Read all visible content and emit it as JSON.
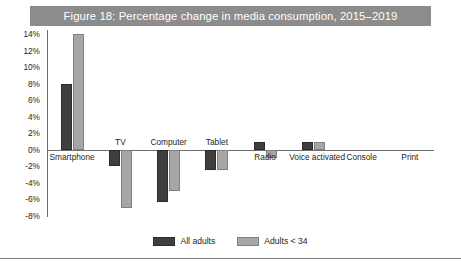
{
  "figure": {
    "title": "Figure 18: Percentage change in media consumption, 2015–2019",
    "title_bar_color": "#8c8c8c"
  },
  "legend": {
    "position": "bottom-center",
    "items": [
      {
        "label": "All adults",
        "color": "#3f3f3f",
        "swatch": "dark-swatch"
      },
      {
        "label": "Adults < 34",
        "color": "#a6a6a6",
        "swatch": "light-swatch"
      }
    ]
  },
  "axis": {
    "yticks": [
      "14%",
      "12%",
      "10%",
      "8%",
      "6%",
      "4%",
      "2%",
      "0%",
      "-2%",
      "-4%",
      "-6%",
      "-8%"
    ],
    "ytick_values": [
      14,
      12,
      10,
      8,
      6,
      4,
      2,
      0,
      -2,
      -4,
      -6,
      -8
    ]
  },
  "chart_data": {
    "type": "bar",
    "title": "Figure 18: Percentage change in media consumption, 2015–2019",
    "xlabel": "",
    "ylabel": "",
    "ylim": [
      -8,
      14
    ],
    "ytick_step": 2,
    "grid": false,
    "legend_position": "bottom-center",
    "categories": [
      "Smartphone",
      "TV",
      "Computer",
      "Tablet",
      "Radio",
      "Voice activated",
      "Console",
      "Print"
    ],
    "series": [
      {
        "name": "All adults",
        "color": "#3f3f3f",
        "values": [
          8,
          -2,
          -6.3,
          -2.5,
          1,
          1,
          0,
          0
        ]
      },
      {
        "name": "Adults < 34",
        "color": "#a6a6a6",
        "values": [
          14,
          -7,
          -5,
          -2.5,
          -1,
          1,
          0,
          0
        ]
      }
    ],
    "units": "percent"
  }
}
